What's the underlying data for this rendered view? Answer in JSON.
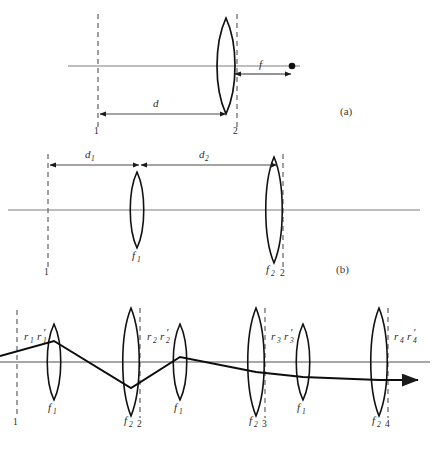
{
  "figure": {
    "type": "optics-ray-diagram",
    "background": "#ffffff",
    "ink_color": "#1a1a1a",
    "axis_color": "#8a8a8a",
    "dash_color": "#6e6e6e"
  },
  "panels": [
    {
      "id": "a",
      "label": "(a)",
      "label_x": 342,
      "label_y": 114,
      "axis": {
        "y": 66,
        "x1": 68,
        "x2": 300
      },
      "planes": [
        {
          "name": "1",
          "x": 98,
          "y_top": 14,
          "y_bottom": 128,
          "tick_label": "1",
          "tick_x": 95,
          "tick_y": 133
        },
        {
          "name": "2",
          "x": 237,
          "y_top": 14,
          "y_bottom": 128,
          "tick_label": "2",
          "tick_x": 234,
          "tick_y": 133
        }
      ],
      "lenses": [
        {
          "x": 226,
          "half_height": 48,
          "bulge": 12,
          "label": "",
          "sub": ""
        }
      ],
      "dimensions": [
        {
          "label": "d",
          "sub": "",
          "x1": 98,
          "x2": 228,
          "y": 114,
          "label_x": 156,
          "label_y": 106,
          "arrow": "both"
        },
        {
          "label": "f",
          "sub": "",
          "x1": 233,
          "x2": 292,
          "y": 74,
          "label_x": 262,
          "label_y": 66,
          "arrow": "both"
        }
      ],
      "focal_point": {
        "x": 292,
        "y": 66,
        "r": 3.2
      }
    },
    {
      "id": "b",
      "label": "(b)",
      "label_x": 338,
      "label_y": 271,
      "axis": {
        "y": 210,
        "x1": 8,
        "x2": 420
      },
      "planes": [
        {
          "name": "1",
          "x": 48,
          "y_top": 154,
          "y_bottom": 268,
          "tick_label": "1",
          "tick_x": 45,
          "tick_y": 274
        },
        {
          "name": "2",
          "x": 283,
          "y_top": 154,
          "y_bottom": 268,
          "tick_label": "2",
          "tick_x": 281,
          "tick_y": 274
        }
      ],
      "lenses": [
        {
          "x": 137,
          "half_height": 38,
          "bulge": 9,
          "label": "f",
          "sub": "1",
          "label_x": 131,
          "label_y": 258
        },
        {
          "x": 274,
          "half_height": 53,
          "bulge": 11,
          "label": "f",
          "sub": "2",
          "label_x": 266,
          "label_y": 272
        }
      ],
      "dimensions": [
        {
          "label": "d",
          "sub": "1",
          "x1": 48,
          "x2": 140,
          "y": 165,
          "label_x": 88,
          "label_y": 157,
          "arrow": "both"
        },
        {
          "label": "d",
          "sub": "2",
          "x1": 140,
          "x2": 278,
          "y": 165,
          "label_x": 202,
          "label_y": 157,
          "arrow": "both"
        }
      ]
    },
    {
      "id": "c",
      "label": "",
      "axis": {
        "y": 362,
        "x1": 0,
        "x2": 432
      },
      "planes": [
        {
          "name": "1",
          "x": 17,
          "y_top": 310,
          "y_bottom": 418,
          "tick_label": "1",
          "tick_x": 14,
          "tick_y": 424
        },
        {
          "name": "2",
          "x": 140,
          "y_top": 308,
          "y_bottom": 418,
          "tick_label": "2",
          "tick_x": 138,
          "tick_y": 424
        },
        {
          "name": "3",
          "x": 265,
          "y_top": 308,
          "y_bottom": 418,
          "tick_label": "3",
          "tick_x": 263,
          "tick_y": 424
        },
        {
          "name": "4",
          "x": 388,
          "y_top": 308,
          "y_bottom": 418,
          "tick_label": "4",
          "tick_x": 386,
          "tick_y": 424
        }
      ],
      "lenses": [
        {
          "x": 54,
          "half_height": 38,
          "bulge": 8,
          "label": "f",
          "sub": "1",
          "label_x": 48,
          "label_y": 410
        },
        {
          "x": 131,
          "half_height": 54,
          "bulge": 11,
          "label": "f",
          "sub": "2",
          "label_x": 124,
          "label_y": 422
        },
        {
          "x": 180,
          "half_height": 38,
          "bulge": 8,
          "label": "f",
          "sub": "1",
          "label_x": 174,
          "label_y": 410
        },
        {
          "x": 256,
          "half_height": 54,
          "bulge": 11,
          "label": "f",
          "sub": "2",
          "label_x": 249,
          "label_y": 422
        },
        {
          "x": 303,
          "half_height": 38,
          "bulge": 8,
          "label": "f",
          "sub": "1",
          "label_x": 297,
          "label_y": 410
        },
        {
          "x": 379,
          "half_height": 54,
          "bulge": 11,
          "label": "f",
          "sub": "2",
          "label_x": 372,
          "label_y": 422
        }
      ],
      "ray_labels": [
        {
          "text": "r",
          "sub": "1",
          "text2": "r",
          "sub2": "1",
          "prime": true,
          "x": 24,
          "y": 338
        },
        {
          "text": "r",
          "sub": "2",
          "text2": "r",
          "sub2": "2",
          "prime": true,
          "x": 147,
          "y": 338
        },
        {
          "text": "r",
          "sub": "3",
          "text2": "r",
          "sub2": "3",
          "prime": true,
          "x": 271,
          "y": 338
        },
        {
          "text": "r",
          "sub": "4",
          "text2": "r",
          "sub2": "4",
          "prime": true,
          "x": 394,
          "y": 338
        }
      ],
      "ray_path": "M 0,356 L 54,341 L 131,388 L 180,357 L 256,372 L 303,377 L 379,380 L 424,380",
      "ray_arrow": {
        "x": 424,
        "y": 380
      }
    }
  ]
}
